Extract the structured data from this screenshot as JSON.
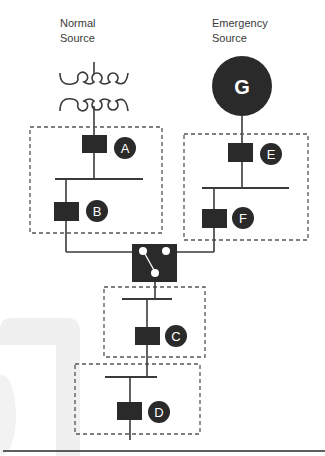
{
  "diagram": {
    "sources": {
      "normal": {
        "line1": "Normal",
        "line2": "Source",
        "symbol": "transformer-icon"
      },
      "emergency": {
        "line1": "Emergency",
        "line2": "Source",
        "symbol": "generator-icon",
        "letter": "G"
      }
    },
    "breakers": [
      {
        "id": "A",
        "label": "A"
      },
      {
        "id": "B",
        "label": "B"
      },
      {
        "id": "C",
        "label": "C"
      },
      {
        "id": "D",
        "label": "D"
      },
      {
        "id": "E",
        "label": "E"
      },
      {
        "id": "F",
        "label": "F"
      }
    ],
    "transfer_switch": {
      "symbol": "automatic-transfer-switch-icon"
    },
    "colors": {
      "line": "#3a3a3a",
      "fill": "#2a2a2a",
      "dashed_box": "#555555",
      "watermark": "#eeeeee"
    }
  }
}
